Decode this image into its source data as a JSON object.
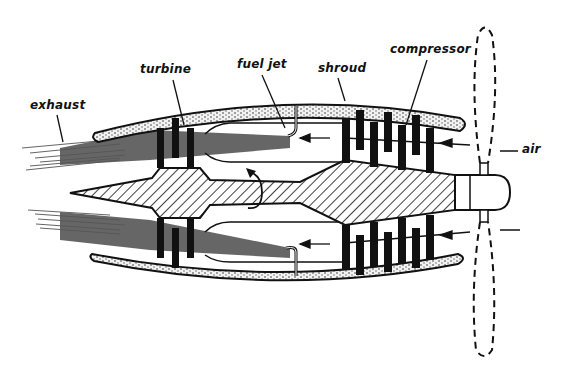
{
  "diagram": {
    "type": "turboprop engine cross-section",
    "colors": {
      "ink": "#111111",
      "flame": "#555555",
      "background": "#ffffff",
      "shroud_fill": "#e6e6e6"
    },
    "labels": {
      "exhaust": "exhaust",
      "turbine": "turbine",
      "fuel_jet": "fuel jet",
      "shroud": "shroud",
      "compressor": "compressor",
      "air": "air"
    }
  }
}
